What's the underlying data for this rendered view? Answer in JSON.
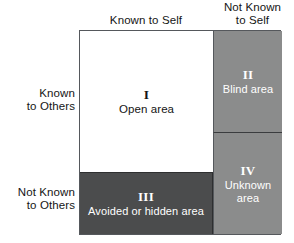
{
  "diagram": {
    "columns": [
      {
        "id": "known-to-self",
        "label": "Known to Self"
      },
      {
        "id": "not-known-to-self",
        "label": "Not Known\nto Self"
      }
    ],
    "rows": [
      {
        "id": "known-to-others",
        "label": "Known\nto Others"
      },
      {
        "id": "not-known-to-others",
        "label": "Not Known\nto Others"
      }
    ],
    "quadrants": [
      {
        "id": "open",
        "numeral": "I",
        "caption": "Open area",
        "fill": "#ffffff",
        "text_color": "#141414"
      },
      {
        "id": "blind",
        "numeral": "II",
        "caption": "Blind area",
        "fill": "#8b8c8c",
        "text_color": "#ffffff"
      },
      {
        "id": "hidden",
        "numeral": "III",
        "caption": "Avoided or hidden area",
        "fill": "#4b4c4d",
        "text_color": "#ffffff"
      },
      {
        "id": "unknown",
        "numeral": "IV",
        "caption": "Unknown\narea",
        "fill": "#8b8c8c",
        "text_color": "#ffffff"
      }
    ],
    "border_color": "#55585c",
    "background": "#ffffff"
  }
}
